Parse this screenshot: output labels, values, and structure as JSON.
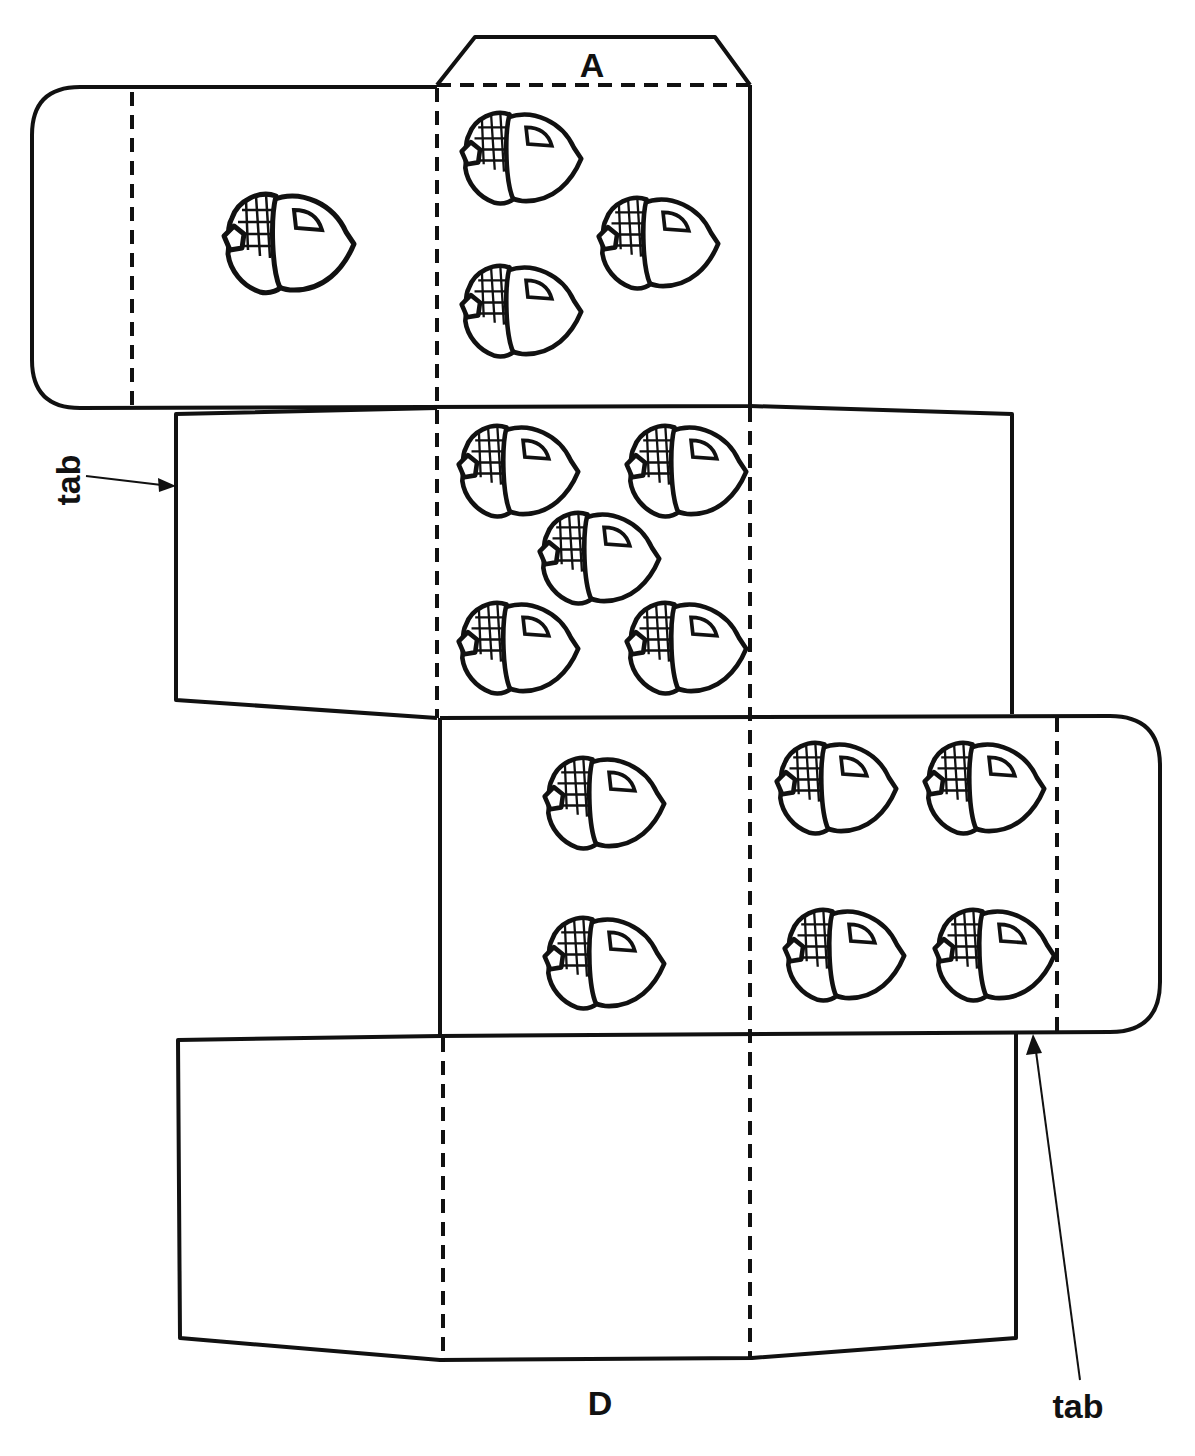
{
  "diagram": {
    "type": "box-net-cutout",
    "labels": {
      "top_flap": "A",
      "bottom_face": "D",
      "tab_left": "tab",
      "tab_right": "tab"
    },
    "panels": [
      {
        "name": "top-flap-A",
        "acorns": 0
      },
      {
        "name": "left-side-panel",
        "acorns": 1
      },
      {
        "name": "face-top-center",
        "acorns": 3
      },
      {
        "name": "face-middle-center",
        "acorns": 5
      },
      {
        "name": "face-lower-center",
        "acorns": 2
      },
      {
        "name": "face-lower-right",
        "acorns": 4
      },
      {
        "name": "face-bottom-D",
        "acorns": 0
      }
    ],
    "colors": {
      "ink": "#111111",
      "paper": "#ffffff"
    }
  }
}
